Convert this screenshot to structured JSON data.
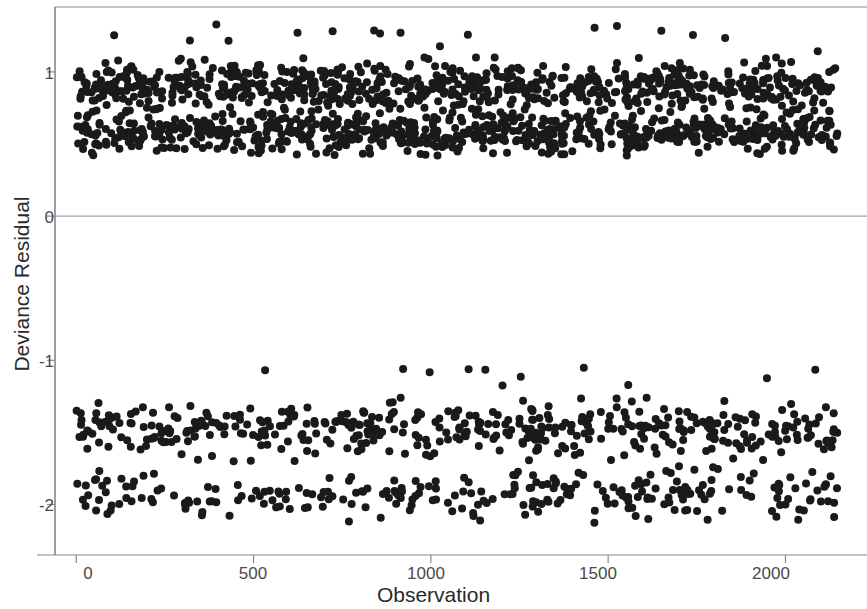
{
  "chart_data": {
    "type": "scatter",
    "title": "",
    "xlabel": "Observation",
    "ylabel": "Deviance Residual",
    "xlim": [
      -60,
      2230
    ],
    "ylim": [
      -2.35,
      1.45
    ],
    "xticks": [
      0,
      500,
      1000,
      1500,
      2000
    ],
    "xtick_labels": [
      "0",
      "500",
      "1000",
      "1500",
      "2000"
    ],
    "yticks": [
      1,
      0,
      -1,
      -2
    ],
    "ytick_labels": [
      "1",
      "0",
      "-1",
      "-2"
    ],
    "grid": false,
    "legend": null,
    "reference_lines": [
      {
        "axis": "y",
        "value": 0,
        "color": "#8a8a8a",
        "width": 1
      }
    ],
    "marker": {
      "shape": "circle",
      "size_px": 8,
      "color": "#1a1a1a",
      "opacity": 1
    },
    "frame": {
      "box": true,
      "color": "#8a8a8a"
    },
    "series": [
      {
        "name": "Deviance Residuals",
        "n_points": 2150,
        "x_range": [
          1,
          2150
        ],
        "description": "Deviance residuals for a binary-outcome model plotted against observation index; residuals separate into a positive band (events, approx 0.42 to 1.32) and a negative band (non-events, approx -2.20 to -1.05), with no residuals near zero.",
        "clusters": [
          {
            "label": "positive-band-upper",
            "y_center": 0.9,
            "y_spread": 0.08,
            "share": 0.33,
            "y_range": [
              0.72,
              1.1
            ]
          },
          {
            "label": "positive-band-lower",
            "y_center": 0.58,
            "y_spread": 0.07,
            "share": 0.33,
            "y_range": [
              0.42,
              0.78
            ]
          },
          {
            "label": "positive-outliers",
            "y_center": 1.24,
            "y_spread": 0.05,
            "share": 0.008,
            "y_range": [
              1.14,
              1.33
            ]
          },
          {
            "label": "negative-band-upper",
            "y_center": -1.48,
            "y_spread": 0.09,
            "share": 0.2,
            "y_range": [
              -1.7,
              -1.25
            ]
          },
          {
            "label": "negative-band-lower",
            "y_center": -1.92,
            "y_spread": 0.09,
            "share": 0.12,
            "y_range": [
              -2.2,
              -1.72
            ]
          },
          {
            "label": "negative-outliers",
            "y_center": -1.12,
            "y_spread": 0.04,
            "share": 0.005,
            "y_range": [
              -1.18,
              -1.05
            ]
          }
        ]
      }
    ]
  },
  "axes": {
    "y_label": "Deviance Residual",
    "x_label": "Observation",
    "y_tick_1": "1",
    "y_tick_0": "0",
    "y_tick_m1": "-1",
    "y_tick_m2": "-2",
    "x_tick_0": "0",
    "x_tick_500": "500",
    "x_tick_1000": "1000",
    "x_tick_1500": "1500",
    "x_tick_2000": "2000"
  }
}
